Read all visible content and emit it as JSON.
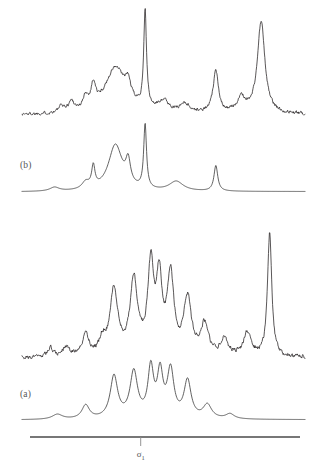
{
  "figure": {
    "background": "#ffffff",
    "trace_color": "#231f20",
    "axis_color": "#4a4a4a",
    "label_color": "#555555"
  },
  "panels": [
    {
      "id": "panel-b",
      "label": "(b)",
      "position": "top"
    },
    {
      "id": "panel-a",
      "label": "(a)",
      "position": "bottom"
    }
  ],
  "axis": {
    "label_symbol": "σ",
    "label_subscript": "1",
    "label_full": "σ₁",
    "tick_position_fraction": 0.41,
    "x_start_px": 30,
    "x_end_px": 300,
    "y_px": 437
  },
  "chart_data": {
    "type": "line",
    "title": "",
    "xlabel": "σ₁",
    "ylabel": "",
    "grid": false,
    "legend": null,
    "axis_ranges": {
      "x": [
        0,
        1
      ],
      "y": [
        0,
        1
      ]
    },
    "panels": [
      {
        "name": "(b)",
        "description": "Sparse spectrum: experimental noisy trace above smooth simulated trace",
        "series": [
          {
            "name": "b-experimental-noisy",
            "style": "noisy",
            "baseline_y": 0.12,
            "peaks": [
              {
                "x": 0.14,
                "height": 0.06,
                "width": 0.012
              },
              {
                "x": 0.175,
                "height": 0.1,
                "width": 0.012
              },
              {
                "x": 0.225,
                "height": 0.12,
                "width": 0.01
              },
              {
                "x": 0.252,
                "height": 0.22,
                "width": 0.01
              },
              {
                "x": 0.33,
                "height": 0.45,
                "width": 0.045
              },
              {
                "x": 0.375,
                "height": 0.16,
                "width": 0.012
              },
              {
                "x": 0.435,
                "height": 0.95,
                "width": 0.006
              },
              {
                "x": 0.5,
                "height": 0.11,
                "width": 0.022
              },
              {
                "x": 0.575,
                "height": 0.09,
                "width": 0.02
              },
              {
                "x": 0.685,
                "height": 0.4,
                "width": 0.012
              },
              {
                "x": 0.775,
                "height": 0.14,
                "width": 0.018
              },
              {
                "x": 0.845,
                "height": 0.9,
                "width": 0.016
              }
            ]
          },
          {
            "name": "b-simulated-smooth",
            "style": "smooth",
            "baseline_y": 0.04,
            "peaks": [
              {
                "x": 0.115,
                "height": 0.06,
                "width": 0.02
              },
              {
                "x": 0.225,
                "height": 0.11,
                "width": 0.016
              },
              {
                "x": 0.252,
                "height": 0.33,
                "width": 0.007
              },
              {
                "x": 0.33,
                "height": 0.72,
                "width": 0.03
              },
              {
                "x": 0.375,
                "height": 0.36,
                "width": 0.01
              },
              {
                "x": 0.435,
                "height": 1.0,
                "width": 0.006
              },
              {
                "x": 0.545,
                "height": 0.15,
                "width": 0.03
              },
              {
                "x": 0.685,
                "height": 0.4,
                "width": 0.008
              }
            ]
          }
        ]
      },
      {
        "name": "(a)",
        "description": "Dense multiplet spectrum: experimental noisy trace above smooth simulated trace, plus isolated sharp line at right",
        "series": [
          {
            "name": "a-experimental-noisy",
            "style": "noisy",
            "baseline_y": 0.12,
            "peaks": [
              {
                "x": 0.1,
                "height": 0.07,
                "width": 0.014
              },
              {
                "x": 0.155,
                "height": 0.07,
                "width": 0.014
              },
              {
                "x": 0.225,
                "height": 0.17,
                "width": 0.014
              },
              {
                "x": 0.285,
                "height": 0.12,
                "width": 0.014
              },
              {
                "x": 0.325,
                "height": 0.52,
                "width": 0.016
              },
              {
                "x": 0.395,
                "height": 0.6,
                "width": 0.016
              },
              {
                "x": 0.455,
                "height": 0.68,
                "width": 0.013
              },
              {
                "x": 0.485,
                "height": 0.58,
                "width": 0.012
              },
              {
                "x": 0.525,
                "height": 0.62,
                "width": 0.014
              },
              {
                "x": 0.585,
                "height": 0.45,
                "width": 0.016
              },
              {
                "x": 0.645,
                "height": 0.24,
                "width": 0.016
              },
              {
                "x": 0.715,
                "height": 0.13,
                "width": 0.016
              },
              {
                "x": 0.795,
                "height": 0.18,
                "width": 0.016
              },
              {
                "x": 0.875,
                "height": 0.98,
                "width": 0.009
              }
            ]
          },
          {
            "name": "a-simulated-smooth",
            "style": "smooth",
            "baseline_y": 0.04,
            "peaks": [
              {
                "x": 0.125,
                "height": 0.08,
                "width": 0.022
              },
              {
                "x": 0.225,
                "height": 0.22,
                "width": 0.016
              },
              {
                "x": 0.325,
                "height": 0.68,
                "width": 0.016
              },
              {
                "x": 0.395,
                "height": 0.74,
                "width": 0.016
              },
              {
                "x": 0.455,
                "height": 0.78,
                "width": 0.012
              },
              {
                "x": 0.488,
                "height": 0.7,
                "width": 0.012
              },
              {
                "x": 0.525,
                "height": 0.76,
                "width": 0.014
              },
              {
                "x": 0.585,
                "height": 0.6,
                "width": 0.015
              },
              {
                "x": 0.655,
                "height": 0.22,
                "width": 0.018
              },
              {
                "x": 0.735,
                "height": 0.08,
                "width": 0.018
              }
            ]
          }
        ]
      }
    ]
  }
}
